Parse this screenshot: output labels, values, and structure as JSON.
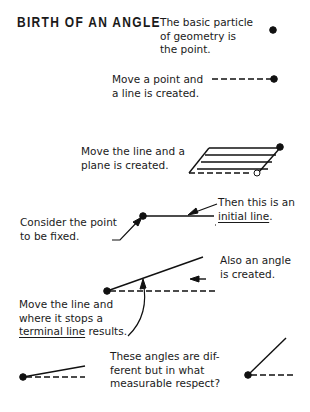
{
  "title": "BIRTH OF AN ANGLE",
  "captions": {
    "point": [
      "The basic particle",
      "of geometry is",
      "the point."
    ],
    "line": [
      "Move a point and",
      "a line is created."
    ],
    "plane": [
      "Move the line and a",
      "plane is created."
    ],
    "initial": {
      "line1": "Then this is an",
      "underlined": "initial line",
      "end": "."
    },
    "fixed": [
      "Consider the point",
      "to be fixed."
    ],
    "angle": [
      "Also an angle",
      "is created."
    ],
    "terminal": {
      "line1": "Move the line and",
      "line2": "where it stops a",
      "underlined": "terminal line",
      "end": " results."
    },
    "question": [
      "These angles are dif-",
      "ferent but in what",
      "measurable respect?"
    ]
  }
}
